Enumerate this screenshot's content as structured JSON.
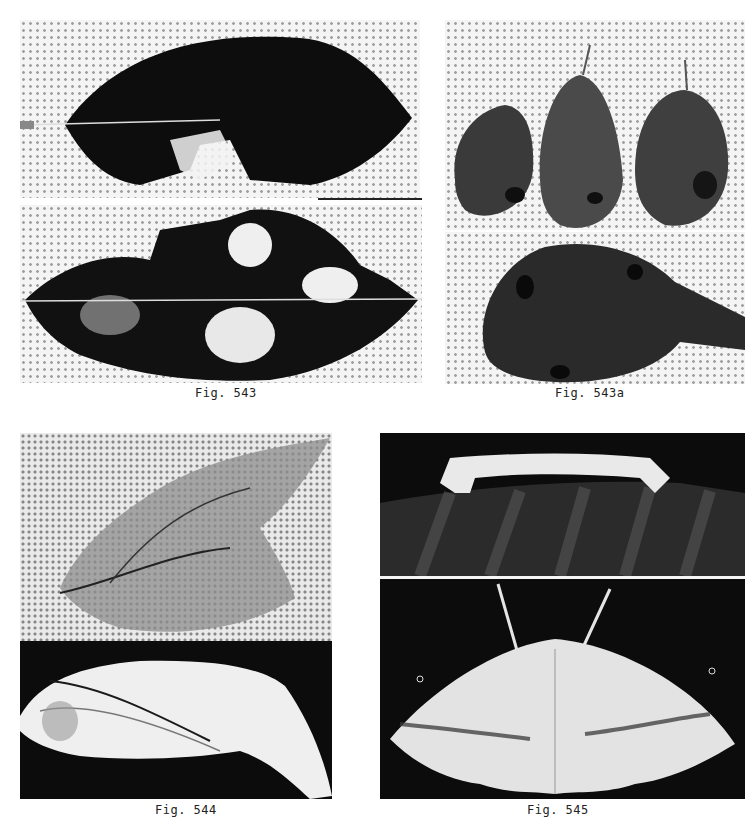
{
  "plate": {
    "figures": [
      {
        "id": "fig-543",
        "caption": "Fig. 543",
        "panels": [
          {
            "subject": "leaf-with-feeding-damage-top"
          },
          {
            "subject": "leaf-with-feeding-damage-bottom"
          }
        ]
      },
      {
        "id": "fig-543a",
        "caption": "Fig. 543a",
        "panels": [
          {
            "subject": "three-pear-fruits"
          },
          {
            "subject": "single-pear-fruit-closeup"
          }
        ]
      },
      {
        "id": "fig-544",
        "caption": "Fig. 544",
        "panels": [
          {
            "subject": "rolled-leaf"
          },
          {
            "subject": "folded-leaf-shelter"
          }
        ]
      },
      {
        "id": "fig-545",
        "caption": "Fig. 545",
        "panels": [
          {
            "subject": "inchworm-caterpillar-on-leaf"
          },
          {
            "subject": "adult-moth-spread-wings"
          }
        ]
      }
    ]
  },
  "colors": {
    "paper": "#ffffff",
    "ink": "#111111",
    "halftone": "#8a8a8a"
  }
}
